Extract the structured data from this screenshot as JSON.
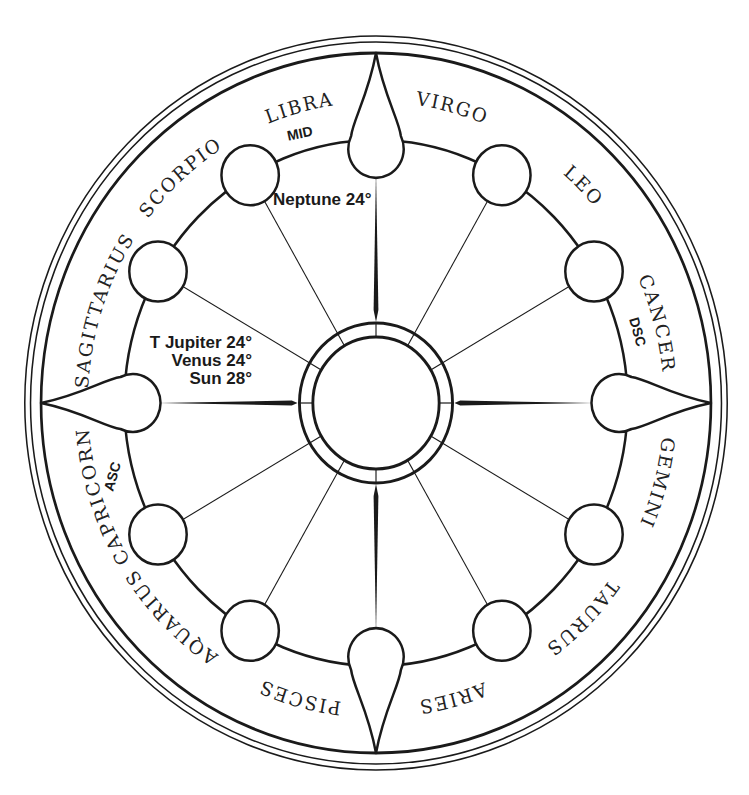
{
  "chart": {
    "signs": [
      {
        "name": "CAPRICORN",
        "position": "top-left of top cusp"
      },
      {
        "name": "SAGITTARIUS",
        "position": "top-right of top cusp"
      },
      {
        "name": "SCORPIO",
        "position": "upper right"
      },
      {
        "name": "LIBRA",
        "position": "right, above right cusp"
      },
      {
        "name": "VIRGO",
        "position": "right, below right cusp"
      },
      {
        "name": "LEO",
        "position": "lower right"
      },
      {
        "name": "CANCER",
        "position": "bottom-right of bottom cusp"
      },
      {
        "name": "GEMINI",
        "position": "bottom-left of bottom cusp"
      },
      {
        "name": "TAURUS",
        "position": "lower left"
      },
      {
        "name": "ARIES",
        "position": "left, below left cusp"
      },
      {
        "name": "PISCES",
        "position": "left, above left cusp"
      },
      {
        "name": "AQUARIUS",
        "position": "upper left"
      }
    ],
    "angles": {
      "mid": "MID",
      "dsc": "DSC",
      "asc": "ASC"
    },
    "planets": {
      "neptune": "Neptune 24°",
      "jupiter": "T Jupiter 24°",
      "venus": "Venus 24°",
      "sun": "Sun 28°"
    },
    "colors": {
      "line": "#1a1a1a",
      "background": "#ffffff"
    }
  }
}
